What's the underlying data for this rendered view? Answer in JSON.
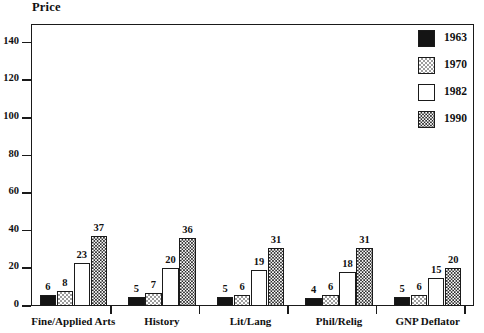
{
  "chart_data": {
    "type": "bar",
    "title": "",
    "ylabel": "Price",
    "xlabel": "",
    "categories": [
      "Fine/Applied Arts",
      "History",
      "Lit/Lang",
      "Phil/Relig",
      "GNP Deflator"
    ],
    "series": [
      {
        "name": "1963",
        "values": [
          6,
          5,
          5,
          4,
          5
        ],
        "swatch": "solid-black",
        "color": "#141414"
      },
      {
        "name": "1970",
        "values": [
          8,
          7,
          6,
          6,
          6
        ],
        "swatch": "light-checker",
        "color": "#9d9d9d"
      },
      {
        "name": "1982",
        "values": [
          23,
          20,
          19,
          18,
          15
        ],
        "swatch": "white",
        "color": "#ffffff"
      },
      {
        "name": "1990",
        "values": [
          37,
          36,
          31,
          31,
          20
        ],
        "swatch": "dark-checker",
        "color": "#2a2a2a"
      }
    ],
    "yticks": [
      0,
      20,
      40,
      60,
      80,
      100,
      120,
      140
    ],
    "ylim": [
      0,
      150
    ],
    "grid": false,
    "legend_position": "top-right",
    "show_value_labels": true
  },
  "legend": {
    "entries": [
      "1963",
      "1970",
      "1982",
      "1990"
    ]
  },
  "axis": {
    "y_title": "Price"
  }
}
